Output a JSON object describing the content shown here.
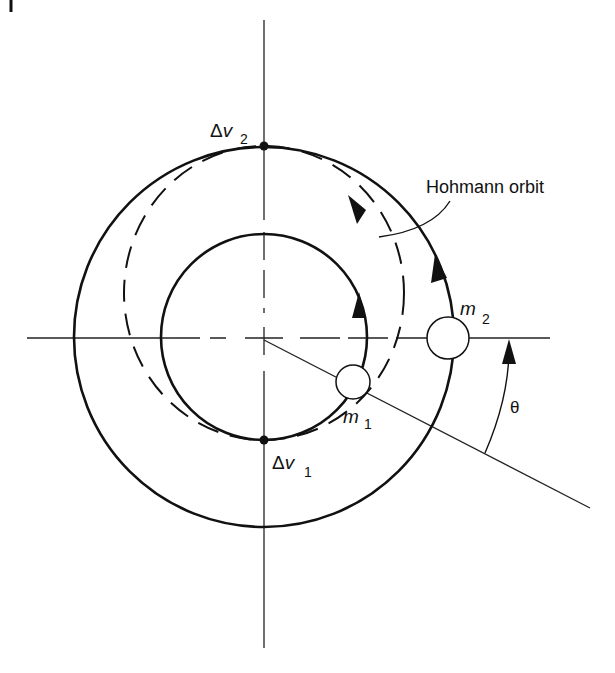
{
  "diagram": {
    "type": "orbital-transfer",
    "labels": {
      "hohmann": "Hohmann orbit",
      "delta": "Δ",
      "v": "v",
      "dv1_sub": "1",
      "dv2_sub": "2",
      "m": "m",
      "m1_sub": "1",
      "m2_sub": "2",
      "theta": "θ"
    },
    "colors": {
      "line": "#111111",
      "background": "#ffffff"
    }
  }
}
